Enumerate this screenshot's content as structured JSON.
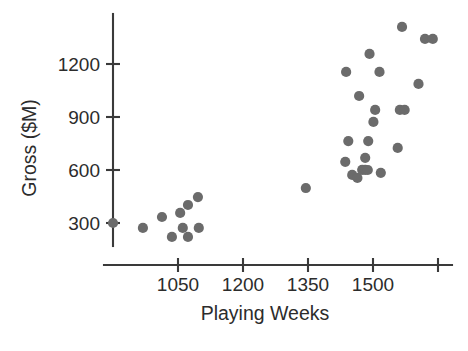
{
  "chart_data": {
    "type": "scatter",
    "title": "",
    "xlabel": "Playing Weeks",
    "ylabel": "Gross ($M)",
    "xlim": [
      980,
      1700
    ],
    "ylim": [
      140,
      1430
    ],
    "grid": false,
    "legend": null,
    "marker_color": "#6b6b6b",
    "axis_color": "#3a3a3a",
    "x_ticks": [
      {
        "value": 1050,
        "label": "1050"
      },
      {
        "value": 1200,
        "label": "1200"
      },
      {
        "value": 1350,
        "label": "1350"
      },
      {
        "value": 1500,
        "label": "1500"
      },
      {
        "value": 1650,
        "label": ""
      }
    ],
    "y_ticks": [
      {
        "value": 300,
        "label": "300"
      },
      {
        "value": 600,
        "label": "600"
      },
      {
        "value": 900,
        "label": "900"
      },
      {
        "value": 1200,
        "label": "1200"
      }
    ],
    "points": [
      {
        "x": 900,
        "y": 300
      },
      {
        "x": 969,
        "y": 272
      },
      {
        "x": 1013,
        "y": 334
      },
      {
        "x": 1055,
        "y": 357
      },
      {
        "x": 1061,
        "y": 272
      },
      {
        "x": 1098,
        "y": 272
      },
      {
        "x": 1073,
        "y": 402
      },
      {
        "x": 1096,
        "y": 447
      },
      {
        "x": 1036,
        "y": 221
      },
      {
        "x": 1073,
        "y": 221
      },
      {
        "x": 1345,
        "y": 498
      },
      {
        "x": 1443,
        "y": 764
      },
      {
        "x": 1489,
        "y": 764
      },
      {
        "x": 1436,
        "y": 646
      },
      {
        "x": 1482,
        "y": 669
      },
      {
        "x": 1518,
        "y": 584
      },
      {
        "x": 1452,
        "y": 572
      },
      {
        "x": 1464,
        "y": 555
      },
      {
        "x": 1475,
        "y": 601
      },
      {
        "x": 1482,
        "y": 601
      },
      {
        "x": 1488,
        "y": 600
      },
      {
        "x": 1557,
        "y": 725
      },
      {
        "x": 1501,
        "y": 872
      },
      {
        "x": 1505,
        "y": 940
      },
      {
        "x": 1562,
        "y": 940
      },
      {
        "x": 1573,
        "y": 940
      },
      {
        "x": 1468,
        "y": 1019
      },
      {
        "x": 1605,
        "y": 1087
      },
      {
        "x": 1438,
        "y": 1155
      },
      {
        "x": 1515,
        "y": 1155
      },
      {
        "x": 1492,
        "y": 1257
      },
      {
        "x": 1567,
        "y": 1410
      },
      {
        "x": 1620,
        "y": 1342
      },
      {
        "x": 1638,
        "y": 1342
      }
    ]
  }
}
